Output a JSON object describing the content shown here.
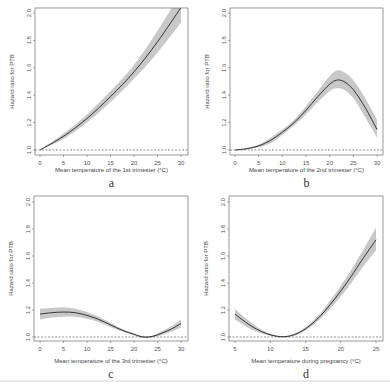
{
  "chart_data": [
    {
      "type": "line",
      "panel_label": "a",
      "xlabel": "Mean temperature of the 1st trimester (°C)",
      "ylabel": "Hazard ratio for PTB",
      "xlim": [
        0,
        30
      ],
      "ylim": [
        1.0,
        2.0
      ],
      "xticks": [
        0,
        5,
        10,
        15,
        20,
        25,
        30
      ],
      "yticks": [
        "1.0",
        "1.2",
        "1.4",
        "1.6",
        "1.8",
        "2.0"
      ],
      "reference_line": 1.0,
      "series": [
        {
          "name": "Hazard ratio",
          "x": [
            0,
            5,
            10,
            15,
            20,
            25,
            30
          ],
          "y": [
            1.0,
            1.1,
            1.23,
            1.39,
            1.57,
            1.79,
            2.04
          ],
          "lower": [
            1.0,
            1.08,
            1.2,
            1.35,
            1.52,
            1.71,
            1.93
          ],
          "upper": [
            1.0,
            1.12,
            1.26,
            1.43,
            1.62,
            1.87,
            2.15
          ]
        }
      ]
    },
    {
      "type": "line",
      "panel_label": "b",
      "xlabel": "Mean temperature of the 2nd trimester (°C)",
      "ylabel": "Hazard ratio for PTB",
      "xlim": [
        0,
        30
      ],
      "ylim": [
        1.0,
        2.0
      ],
      "xticks": [
        0,
        5,
        10,
        15,
        20,
        25,
        30
      ],
      "yticks": [
        "1.0",
        "1.2",
        "1.4",
        "1.6",
        "1.8",
        "2.0"
      ],
      "reference_line": 1.0,
      "series": [
        {
          "name": "Hazard ratio",
          "x": [
            0,
            2.5,
            5,
            7.5,
            10,
            12.5,
            15,
            17.5,
            20,
            21.5,
            23,
            25,
            27.5,
            30
          ],
          "y": [
            1.0,
            1.01,
            1.03,
            1.07,
            1.13,
            1.2,
            1.29,
            1.39,
            1.48,
            1.51,
            1.5,
            1.44,
            1.31,
            1.15
          ],
          "lower": [
            1.0,
            1.005,
            1.02,
            1.05,
            1.11,
            1.18,
            1.26,
            1.35,
            1.43,
            1.45,
            1.44,
            1.38,
            1.24,
            1.09
          ],
          "upper": [
            1.0,
            1.015,
            1.04,
            1.09,
            1.15,
            1.22,
            1.32,
            1.43,
            1.54,
            1.58,
            1.57,
            1.51,
            1.38,
            1.22
          ]
        }
      ]
    },
    {
      "type": "line",
      "panel_label": "c",
      "xlabel": "Mean temperature of the 3rd trimester (°C)",
      "ylabel": "Hazard ratio for PTB",
      "xlim": [
        0,
        30
      ],
      "ylim": [
        1.0,
        2.0
      ],
      "xticks": [
        0,
        5,
        10,
        15,
        20,
        25,
        30
      ],
      "yticks": [
        "1.0",
        "1.2",
        "1.4",
        "1.6",
        "1.8",
        "2.0"
      ],
      "reference_line": 1.0,
      "series": [
        {
          "name": "Hazard ratio",
          "x": [
            0,
            2.5,
            5,
            7.5,
            10,
            12.5,
            15,
            17.5,
            20,
            22,
            24,
            26,
            28,
            30
          ],
          "y": [
            1.17,
            1.18,
            1.185,
            1.18,
            1.16,
            1.13,
            1.09,
            1.05,
            1.02,
            1.0,
            1.005,
            1.03,
            1.06,
            1.1
          ],
          "lower": [
            1.13,
            1.145,
            1.15,
            1.15,
            1.135,
            1.11,
            1.075,
            1.04,
            1.012,
            0.995,
            0.998,
            1.015,
            1.04,
            1.07
          ],
          "upper": [
            1.21,
            1.215,
            1.22,
            1.21,
            1.185,
            1.15,
            1.105,
            1.06,
            1.028,
            1.005,
            1.012,
            1.045,
            1.08,
            1.13
          ]
        }
      ]
    },
    {
      "type": "line",
      "panel_label": "d",
      "xlabel": "Mean temperature during pregnancy (°C)",
      "ylabel": "Hazard ratio for PTB",
      "xlim": [
        5,
        25
      ],
      "ylim": [
        1.0,
        2.0
      ],
      "xticks": [
        5,
        10,
        15,
        20,
        25
      ],
      "yticks": [
        "1.0",
        "1.2",
        "1.4",
        "1.6",
        "1.8",
        "2.0"
      ],
      "reference_line": 1.0,
      "series": [
        {
          "name": "Hazard ratio",
          "x": [
            5,
            6.5,
            8,
            9.5,
            11,
            12.5,
            14,
            15.5,
            17,
            18.5,
            20,
            21.5,
            23,
            25
          ],
          "y": [
            1.17,
            1.11,
            1.06,
            1.025,
            1.005,
            1.005,
            1.03,
            1.08,
            1.15,
            1.24,
            1.34,
            1.45,
            1.57,
            1.72
          ],
          "lower": [
            1.13,
            1.08,
            1.04,
            1.015,
            1.0,
            1.0,
            1.02,
            1.065,
            1.13,
            1.21,
            1.3,
            1.4,
            1.51,
            1.64
          ],
          "upper": [
            1.21,
            1.14,
            1.08,
            1.035,
            1.01,
            1.01,
            1.04,
            1.095,
            1.17,
            1.27,
            1.38,
            1.5,
            1.63,
            1.81
          ]
        }
      ]
    }
  ],
  "colors": {
    "line": "#222222",
    "band": "#c8c8c8",
    "axis": "#555555",
    "reference": "#444444"
  }
}
